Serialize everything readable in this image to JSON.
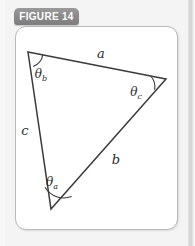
{
  "figure": {
    "tab_label": "FIGURE 14",
    "card_background": "#ffffff",
    "page_background": "#f4f4f4",
    "tab_color": "#8a8a8a",
    "stroke_color": "#3a3a3a"
  },
  "diagram": {
    "type": "triangle",
    "vertices": [
      {
        "name": "vertex-b",
        "x": 28,
        "y": 52
      },
      {
        "name": "vertex-c",
        "x": 166,
        "y": 79
      },
      {
        "name": "vertex-a",
        "x": 51,
        "y": 209
      }
    ],
    "sides": [
      {
        "id": "a",
        "label": "a",
        "from": "vertex-b",
        "to": "vertex-c",
        "label_x": 101,
        "label_y": 58
      },
      {
        "id": "b",
        "label": "b",
        "from": "vertex-c",
        "to": "vertex-a",
        "label_x": 116,
        "label_y": 164
      },
      {
        "id": "c",
        "label": "c",
        "from": "vertex-a",
        "to": "vertex-b",
        "label_x": 25,
        "label_y": 135
      }
    ],
    "angles": [
      {
        "id": "theta_b",
        "symbol": "θ",
        "subscript": "b",
        "at": "vertex-b",
        "label_x": 41,
        "label_y": 78
      },
      {
        "id": "theta_c",
        "symbol": "θ",
        "subscript": "c",
        "at": "vertex-c",
        "label_x": 136,
        "label_y": 96
      },
      {
        "id": "theta_a",
        "symbol": "θ",
        "subscript": "a",
        "at": "vertex-a",
        "label_x": 52,
        "label_y": 186
      }
    ]
  }
}
